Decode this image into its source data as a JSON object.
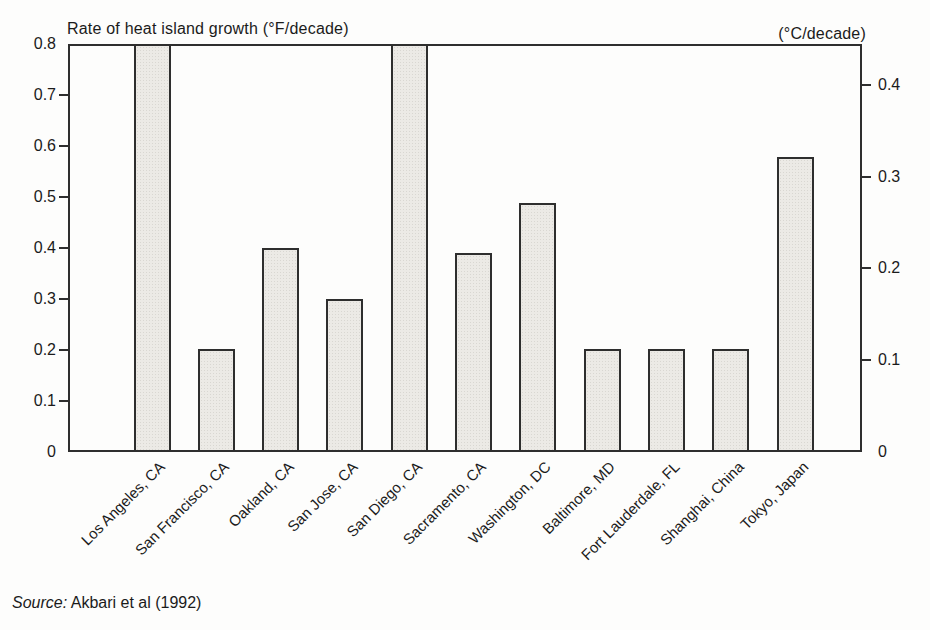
{
  "chart_data": {
    "type": "bar",
    "title": "Rate of heat island growth (°F/decade)",
    "right_axis_title": "(°C/decade)",
    "categories": [
      "Los Angeles, CA",
      "San Francisco, CA",
      "Oakland, CA",
      "San Jose, CA",
      "San Diego, CA",
      "Sacramento, CA",
      "Washington, DC",
      "Baltimore, MD",
      "Fort Lauderdale, FL",
      "Shanghai, China",
      "Tokyo, Japan"
    ],
    "values": [
      0.8,
      0.2,
      0.4,
      0.3,
      0.8,
      0.39,
      0.49,
      0.2,
      0.2,
      0.2,
      0.58
    ],
    "clipped_above_axis": [
      true,
      false,
      false,
      false,
      true,
      false,
      false,
      false,
      false,
      false,
      false
    ],
    "left_axis": {
      "unit": "°F/decade",
      "range": [
        0,
        0.8
      ],
      "tick_labels": [
        "0.8",
        "0.7",
        "0.6",
        "0.5",
        "0.4",
        "0.3",
        "0.2",
        "0.1",
        "0"
      ],
      "tick_values": [
        0.8,
        0.7,
        0.6,
        0.5,
        0.4,
        0.3,
        0.2,
        0.1,
        0
      ]
    },
    "right_axis": {
      "unit": "°C/decade",
      "tick_labels": [
        "0.4",
        "0.3",
        "0.2",
        "0.1",
        "0"
      ],
      "tick_values": [
        0.4,
        0.3,
        0.2,
        0.1,
        0
      ],
      "conversion": "°C = °F / 1.8"
    },
    "grid": false,
    "legend": false,
    "source": {
      "label": "Source:",
      "text": "Akbari et al (1992)"
    },
    "colors": {
      "background": "#fdfdfc",
      "bar_fill": "#eceae6",
      "bar_dot": "#d9d7d2",
      "line": "#2e2e2e",
      "ink": "#1b1b1b"
    }
  }
}
